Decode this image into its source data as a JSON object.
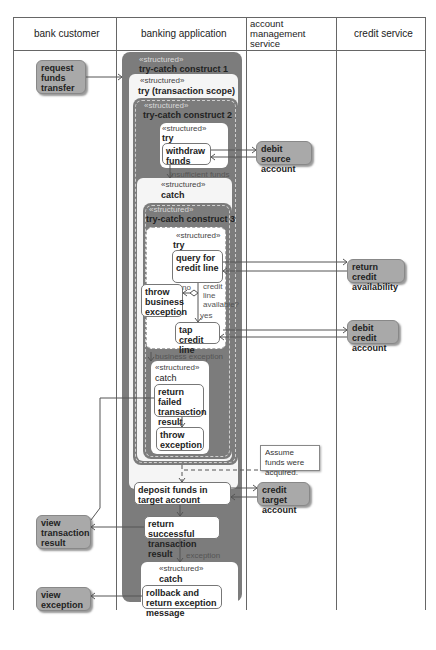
{
  "lanes": [
    {
      "id": "bank-customer",
      "label": "bank customer"
    },
    {
      "id": "banking-application",
      "label": "banking application"
    },
    {
      "id": "account-management-service",
      "label": "account management service"
    },
    {
      "id": "credit-service",
      "label": "credit service"
    }
  ],
  "stereotype": "«structured»",
  "regions": {
    "try_catch_1": {
      "title": "try-catch construct 1"
    },
    "try_transaction": {
      "title": "try (transaction scope)"
    },
    "try_catch_2": {
      "title": "try-catch construct 2"
    },
    "try_2": {
      "title": "try"
    },
    "catch_2": {
      "title": "catch"
    },
    "try_catch_3": {
      "title": "try-catch construct 3"
    },
    "try_3": {
      "title": "try"
    },
    "catch_3": {
      "title": "catch"
    },
    "catch_1": {
      "title": "catch"
    }
  },
  "actions": {
    "request_funds_transfer": "request funds transfer",
    "withdraw_funds": "withdraw funds",
    "debit_source_account": "debit source account",
    "query_credit_line": "query for credit line",
    "return_credit_availability": "return credit availability",
    "throw_business_exception": "throw business exception",
    "tap_credit_line": "tap credit line",
    "debit_credit_account": "debit credit account",
    "return_failed_result": "return failed transaction result",
    "throw_exception": "throw exception",
    "deposit_funds": "deposit funds in target account",
    "credit_target_account": "credit target account",
    "return_successful_result": "return successful transaction result",
    "view_transaction_result": "view transaction result",
    "rollback_return": "rollback and return exception message",
    "view_exception": "view exception"
  },
  "edge_labels": {
    "insufficient_funds": "insufficient funds",
    "no": "no",
    "credit_line_available": "credit line available?",
    "yes": "yes",
    "business_exception": "business exception",
    "exception": "exception"
  },
  "note": "Assume funds were acquired.",
  "colors": {
    "lane_line": "#666666",
    "dark_region": "#7c7c7c",
    "external_action": "#a9a9a9",
    "light_region": "#f5f5f5"
  }
}
